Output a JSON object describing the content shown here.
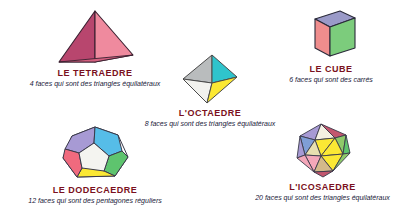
{
  "page": {
    "background_color": "#ffffff",
    "title_color": "#7a1020",
    "description_color": "#1a1a3a"
  },
  "solids": [
    {
      "id": "tetrahedron",
      "icon": "tetrahedron-icon",
      "title": "LE TETRAEDRE",
      "description": "4 faces qui sont des triangles équilatéraux",
      "faces": 4,
      "face_shape": "triangle équilatéral",
      "colors": {
        "left": "#b8466e",
        "right": "#ef8a9e",
        "outline": "#3a2030"
      }
    },
    {
      "id": "octahedron",
      "icon": "octahedron-icon",
      "title": "L'OCTAEDRE",
      "description": "8 faces qui sont des triangles équilatéraux",
      "faces": 8,
      "face_shape": "triangle équilatéral",
      "colors": {
        "top_left": "#b9bcbd",
        "top_right": "#2fc4cc",
        "bottom_left": "#f2f2ee",
        "bottom_right": "#fbe834",
        "outline": "#4a4a4a"
      }
    },
    {
      "id": "cube",
      "icon": "cube-icon",
      "title": "LE CUBE",
      "description": "6 faces qui sont des carrés",
      "faces": 6,
      "face_shape": "carré",
      "colors": {
        "top": "#9a9ac8",
        "left": "#ef8d8d",
        "front": "#7ccc7c",
        "outline": "#2a2a3a"
      }
    },
    {
      "id": "dodecahedron",
      "icon": "dodecahedron-icon",
      "title": "LE DODECAEDRE",
      "description": "12 faces qui sont des pentagones réguliers",
      "faces": 12,
      "face_shape": "pentagone régulier",
      "colors": {
        "center": "#f4f4f0",
        "upper_left": "#a79ad4",
        "upper_right": "#56bde8",
        "right": "#5ec46e",
        "bottom": "#fbe834",
        "left": "#f06a7e",
        "outline": "#3a3a4a"
      }
    },
    {
      "id": "icosahedron",
      "icon": "icosahedron-icon",
      "title": "L'ICOSAEDRE",
      "description": "20 faces qui sont des triangles équilatéraux",
      "faces": 20,
      "face_shape": "triangle équilatéral",
      "colors": {
        "palette": [
          "#a79ad4",
          "#f4f0e2",
          "#c2566e",
          "#6aa8dc",
          "#fbe834",
          "#8ec96a",
          "#f4a7b9",
          "#e8e0b0",
          "#7f9ed6",
          "#d4b98a"
        ],
        "outline": "#3a3a4a"
      }
    }
  ]
}
